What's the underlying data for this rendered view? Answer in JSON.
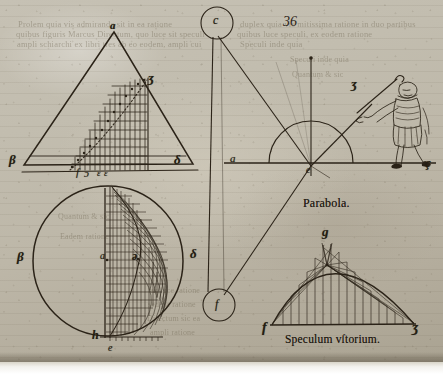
{
  "page": {
    "folio_number": "36",
    "background_color": "#bdb7a8",
    "ink_color": "#241d12"
  },
  "ghost_text": {
    "note": "illegible bleed-through print from verso",
    "lines": [
      "Prolem quia vis admiranda sit in ea ratione",
      "quibus figuris Marcus Directum, quo luce sit speculi",
      "ampli schiarchi ex libri tres ab eo eodem, ampli cui",
      "duplex quia vis mitissima ratione in duo partibus",
      "quibus luce speculi, ex eodem ratione",
      "Speculi inde quia",
      "Quantum & sic",
      "Eadem ratione",
      "ex luce ratione",
      "sed ita ratione",
      "Directum sic ea",
      "ampli ratione"
    ]
  },
  "figures": {
    "triangle": {
      "name": "upper-triangle-diagram",
      "labels": [
        {
          "text": "a",
          "x": 110,
          "y": 22,
          "size": 11,
          "bold": true
        },
        {
          "text": "ʒ",
          "x": 146,
          "y": 77,
          "size": 12,
          "bold": true
        },
        {
          "text": "β",
          "x": 10,
          "y": 158,
          "size": 12,
          "bold": true
        },
        {
          "text": "δ",
          "x": 174,
          "y": 158,
          "size": 12,
          "bold": true
        },
        {
          "text": "f",
          "x": 75,
          "y": 172,
          "size": 10,
          "bold": false
        },
        {
          "text": "ɔ",
          "x": 84,
          "y": 172,
          "size": 10,
          "bold": false
        },
        {
          "text": "ε",
          "x": 97,
          "y": 173,
          "size": 9,
          "bold": false
        },
        {
          "text": "ε",
          "x": 104,
          "y": 173,
          "size": 9,
          "bold": false
        }
      ]
    },
    "semicircle": {
      "name": "reflection-semicircle-diagram",
      "labels": [
        {
          "text": "a",
          "x": 230,
          "y": 158,
          "size": 11,
          "bold": false
        },
        {
          "text": "e",
          "x": 311,
          "y": 172,
          "size": 10,
          "bold": false
        },
        {
          "text": "ʒ",
          "x": 352,
          "y": 83,
          "size": 12,
          "bold": true
        },
        {
          "text": "ç",
          "x": 425,
          "y": 162,
          "size": 12,
          "bold": true
        }
      ]
    },
    "ray_circles": {
      "name": "ray-endpoint-circles",
      "labels": [
        {
          "text": "c",
          "x": 212,
          "y": 16,
          "size": 11,
          "bold": false
        },
        {
          "text": "f",
          "x": 215,
          "y": 297,
          "size": 11,
          "bold": false
        }
      ]
    },
    "circle": {
      "name": "lower-circle-diagram",
      "labels": [
        {
          "text": "β",
          "x": 18,
          "y": 255,
          "size": 12,
          "bold": true
        },
        {
          "text": "δ",
          "x": 190,
          "y": 252,
          "size": 12,
          "bold": true
        },
        {
          "text": "a",
          "x": 106,
          "y": 256,
          "size": 10,
          "bold": false
        },
        {
          "text": "ə",
          "x": 136,
          "y": 256,
          "size": 11,
          "bold": true
        },
        {
          "text": "h",
          "x": 93,
          "y": 334,
          "size": 11,
          "bold": true
        },
        {
          "text": "e",
          "x": 109,
          "y": 348,
          "size": 10,
          "bold": false
        }
      ]
    },
    "parabola": {
      "name": "parabola-burning-mirror-diagram",
      "title": "Parabola.",
      "caption": "Speculum vſtorium.",
      "labels": [
        {
          "text": "g",
          "x": 322,
          "y": 231,
          "size": 12,
          "bold": true
        },
        {
          "text": "f",
          "x": 265,
          "y": 327,
          "size": 12,
          "bold": true
        },
        {
          "text": "ʒ",
          "x": 411,
          "y": 327,
          "size": 12,
          "bold": true
        }
      ]
    },
    "man": {
      "name": "man-with-staff-figure",
      "description": "standing man holding long rod pointing at semicircle"
    }
  }
}
